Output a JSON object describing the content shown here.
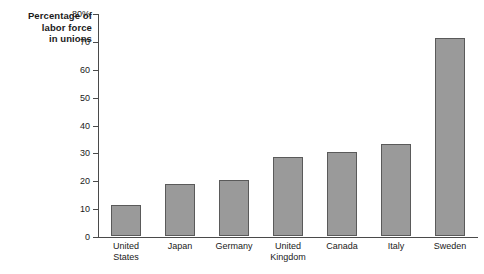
{
  "chart_data": {
    "type": "bar",
    "title_lines": [
      "Percentage of",
      "labor force",
      "in unions"
    ],
    "xlabel": "",
    "ylabel": "Percentage of labor force in unions",
    "categories": [
      "United States",
      "Japan",
      "Germany",
      "United Kingdom",
      "Canada",
      "Italy",
      "Sweden"
    ],
    "category_lines": [
      [
        "United",
        "States"
      ],
      [
        "Japan"
      ],
      [
        "Germany"
      ],
      [
        "United",
        "Kingdom"
      ],
      [
        "Canada"
      ],
      [
        "Italy"
      ],
      [
        "Sweden"
      ]
    ],
    "values": [
      11,
      18.5,
      20,
      28.5,
      30,
      33,
      71
    ],
    "ylim": [
      0,
      80
    ],
    "ytick_values": [
      0,
      10,
      20,
      30,
      40,
      50,
      60,
      70,
      80
    ],
    "ytick_labels": [
      "0",
      "10",
      "20",
      "30",
      "40",
      "50",
      "60",
      "70",
      "80%"
    ],
    "grid": false,
    "legend": null,
    "bar_fill_color": "#9a9a9a",
    "bar_border_color": "#5a5a5a",
    "axis_color": "#4a4a4a",
    "text_color": "#1a1a1a",
    "background_color": "#ffffff"
  }
}
